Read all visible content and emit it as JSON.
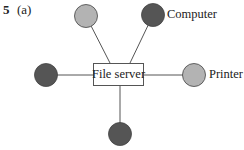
{
  "question": {
    "number": "5",
    "part": "(a)"
  },
  "diagram": {
    "type": "star-network",
    "hub": {
      "label": "File server"
    },
    "nodes": [
      {
        "id": "top-left",
        "fill": "#b3b3b3",
        "label": ""
      },
      {
        "id": "top-right",
        "fill": "#555555",
        "label": "Computer"
      },
      {
        "id": "left",
        "fill": "#555555",
        "label": ""
      },
      {
        "id": "right",
        "fill": "#b3b3b3",
        "label": "Printer"
      },
      {
        "id": "bottom",
        "fill": "#555555",
        "label": ""
      }
    ],
    "legend_colors": {
      "computer": "#555555",
      "printer": "#b3b3b3"
    }
  }
}
